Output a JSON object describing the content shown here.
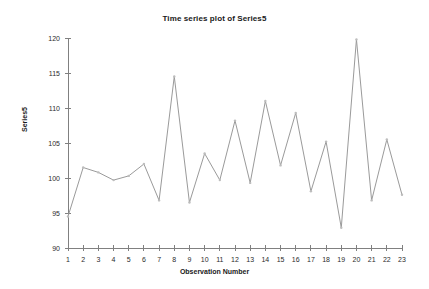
{
  "chart_data": {
    "type": "line",
    "title": "Time series plot of Series5",
    "xlabel": "Observation Number",
    "ylabel": "Series5",
    "x": [
      1,
      2,
      3,
      4,
      5,
      6,
      7,
      8,
      9,
      10,
      11,
      12,
      13,
      14,
      15,
      16,
      17,
      18,
      19,
      20,
      21,
      22,
      23
    ],
    "categories": [
      "1",
      "2",
      "3",
      "4",
      "5",
      "6",
      "7",
      "8",
      "9",
      "10",
      "11",
      "12",
      "13",
      "14",
      "15",
      "16",
      "17",
      "18",
      "19",
      "20",
      "21",
      "22",
      "23"
    ],
    "values": [
      94.5,
      101.5,
      100.8,
      99.7,
      100.3,
      102.0,
      96.8,
      114.5,
      96.5,
      103.5,
      99.7,
      108.2,
      99.3,
      111.0,
      101.8,
      109.3,
      98.1,
      105.2,
      92.9,
      119.8,
      96.8,
      105.5,
      97.6
    ],
    "series": [
      {
        "name": "Series5",
        "values": [
          94.5,
          101.5,
          100.8,
          99.7,
          100.3,
          102.0,
          96.8,
          114.5,
          96.5,
          103.5,
          99.7,
          108.2,
          99.3,
          111.0,
          101.8,
          109.3,
          98.1,
          105.2,
          92.9,
          119.8,
          96.8,
          105.5,
          97.6
        ]
      }
    ],
    "ylim": [
      90,
      120
    ],
    "xlim": [
      1,
      23
    ],
    "ytick_labels": [
      "90",
      "95",
      "100",
      "105",
      "110",
      "115",
      "120"
    ],
    "ytick_values": [
      90,
      95,
      100,
      105,
      110,
      115,
      120
    ],
    "xtick_labels": [
      "1",
      "2",
      "3",
      "4",
      "5",
      "6",
      "7",
      "8",
      "9",
      "10",
      "11",
      "12",
      "13",
      "14",
      "15",
      "16",
      "17",
      "18",
      "19",
      "20",
      "21",
      "22",
      "23"
    ],
    "grid": false,
    "legend": "none",
    "line_color": "#9a9a9a",
    "marker_color": "#bdbdbd",
    "axis_color": "#808080",
    "background_color": "#ffffff"
  }
}
